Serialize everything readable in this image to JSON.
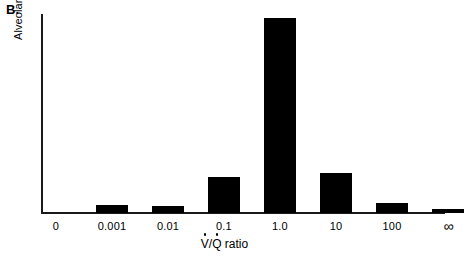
{
  "panel": {
    "label": "B."
  },
  "axes": {
    "y_title": "Alveolar blood flow",
    "x_title_prefix": "",
    "x_title_v": "V",
    "x_title_slash": "/",
    "x_title_q": "Q",
    "x_title_suffix": " ratio",
    "x_title_plain": "V̇/Q̇ ratio"
  },
  "chart_data": {
    "type": "bar",
    "title": "B.",
    "xlabel": "V̇/Q̇ ratio",
    "ylabel": "Alveolar blood flow",
    "categories": [
      "0",
      "0.001",
      "0.01",
      "0.1",
      "1.0",
      "10",
      "100",
      "∞"
    ],
    "values": [
      0,
      4,
      3.5,
      18,
      98,
      20,
      5,
      2
    ],
    "ylim": [
      0,
      100
    ],
    "grid": false,
    "legend": null,
    "bar_color": "#000000"
  },
  "ticks": [
    {
      "label": "0",
      "value": 0
    },
    {
      "label": "0.001",
      "value": 4
    },
    {
      "label": "0.01",
      "value": 3.5
    },
    {
      "label": "0.1",
      "value": 18
    },
    {
      "label": "1.0",
      "value": 98
    },
    {
      "label": "10",
      "value": 20
    },
    {
      "label": "100",
      "value": 5
    },
    {
      "label": "∞",
      "value": 2
    }
  ]
}
